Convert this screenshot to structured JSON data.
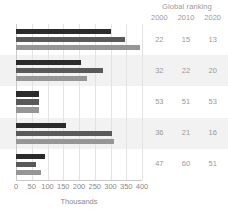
{
  "ranking": {
    "title": "Global ranking",
    "years": [
      "2000",
      "2010",
      "2020"
    ],
    "rows": [
      [
        "22",
        "15",
        "13"
      ],
      [
        "32",
        "22",
        "20"
      ],
      [
        "53",
        "51",
        "53"
      ],
      [
        "36",
        "21",
        "16"
      ],
      [
        "47",
        "60",
        "51"
      ]
    ]
  },
  "colors": {
    "series_2000": "#2b2b2b",
    "series_2010": "#595959",
    "series_2020": "#969696",
    "band": "#f2f2f2",
    "grid": "#e3e3e3",
    "axis": "#c9c9c9",
    "text": "#8a8a8a"
  },
  "chart_data": {
    "type": "bar",
    "orientation": "horizontal",
    "title": "",
    "xlabel": "Thousands",
    "ylabel": "",
    "xlim": [
      0,
      400
    ],
    "xticks": [
      "0",
      "50",
      "100",
      "150",
      "200",
      "250",
      "300",
      "350",
      "400"
    ],
    "xtick_values": [
      0,
      50,
      100,
      150,
      200,
      250,
      300,
      350,
      400
    ],
    "grid": true,
    "legend": "none",
    "categories": [
      "1",
      "2",
      "3",
      "4",
      "5"
    ],
    "series": [
      {
        "name": "2000",
        "values": [
          300,
          205,
          72,
          160,
          93
        ]
      },
      {
        "name": "2010",
        "values": [
          345,
          275,
          74,
          305,
          62
        ]
      },
      {
        "name": "2020",
        "values": [
          395,
          225,
          73,
          312,
          80
        ]
      }
    ]
  }
}
